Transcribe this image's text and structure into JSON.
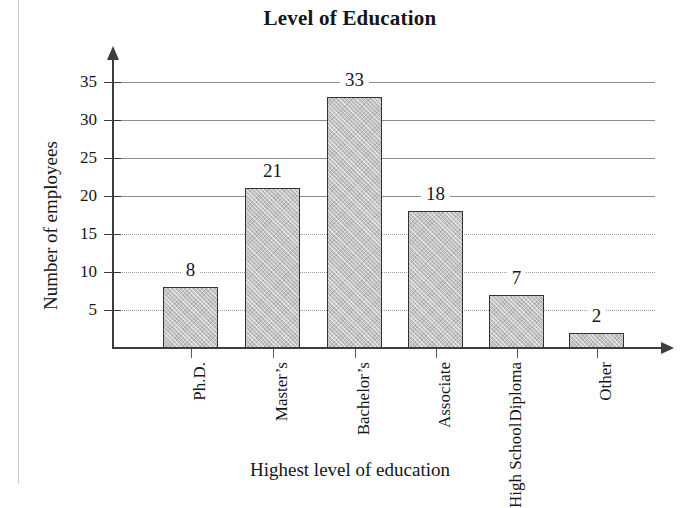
{
  "chart_data": {
    "type": "bar",
    "title": "Level of Education",
    "xlabel": "Highest level of education",
    "ylabel": "Number of employees",
    "categories": [
      "Ph.D.",
      "Master’s",
      "Bachelor’s",
      "Associate",
      "High School Diploma",
      "Other"
    ],
    "category_lines": [
      [
        "Ph.D."
      ],
      [
        "Master’s"
      ],
      [
        "Bachelor’s"
      ],
      [
        "Associate"
      ],
      [
        "High School",
        "Diploma"
      ],
      [
        "Other"
      ]
    ],
    "values": [
      8,
      21,
      33,
      18,
      7,
      2
    ],
    "value_labels": [
      "8",
      "21",
      "33",
      "18",
      "7",
      "2"
    ],
    "ylim": [
      0,
      35
    ],
    "yticks": [
      5,
      10,
      15,
      20,
      25,
      30,
      35
    ],
    "ytick_labels": [
      "5",
      "10",
      "15",
      "20",
      "25",
      "30",
      "35"
    ],
    "grid": true,
    "legend": false,
    "bar_fill_color": "#c3c3c3",
    "bar_border_color": "#333333",
    "axis_color": "#3d3d3d",
    "grid_color": "#8d8d8d",
    "background_color": "#ffffff"
  }
}
